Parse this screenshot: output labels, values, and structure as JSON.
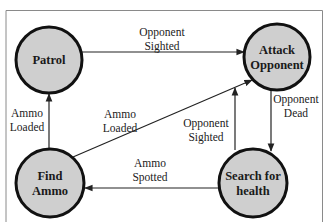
{
  "diagram": {
    "type": "state-machine",
    "nodes": [
      {
        "id": "patrol",
        "lines": [
          "Patrol"
        ]
      },
      {
        "id": "attack",
        "lines": [
          "Attack",
          "Opponent"
        ]
      },
      {
        "id": "find_ammo",
        "lines": [
          "Find",
          "Ammo"
        ]
      },
      {
        "id": "search_health",
        "lines": [
          "Search for",
          "health"
        ]
      }
    ],
    "edges": [
      {
        "from": "patrol",
        "to": "attack",
        "label": [
          "Opponent",
          "Sighted"
        ]
      },
      {
        "from": "find_ammo",
        "to": "patrol",
        "label": [
          "Ammo",
          "Loaded"
        ]
      },
      {
        "from": "find_ammo",
        "to": "attack",
        "label": [
          "Ammo",
          "Loaded"
        ]
      },
      {
        "from": "search_health",
        "to": "attack",
        "label": [
          "Opponent",
          "Sighted"
        ]
      },
      {
        "from": "attack",
        "to": "search_health",
        "label": [
          "Opponent",
          "Dead"
        ]
      },
      {
        "from": "search_health",
        "to": "find_ammo",
        "label": [
          "Ammo",
          "Spotted"
        ]
      }
    ]
  },
  "colors": {
    "node_fill": "#cfcfcf",
    "node_stroke": "#111111",
    "edge": "#222222",
    "frame": "#8a8a8a"
  }
}
